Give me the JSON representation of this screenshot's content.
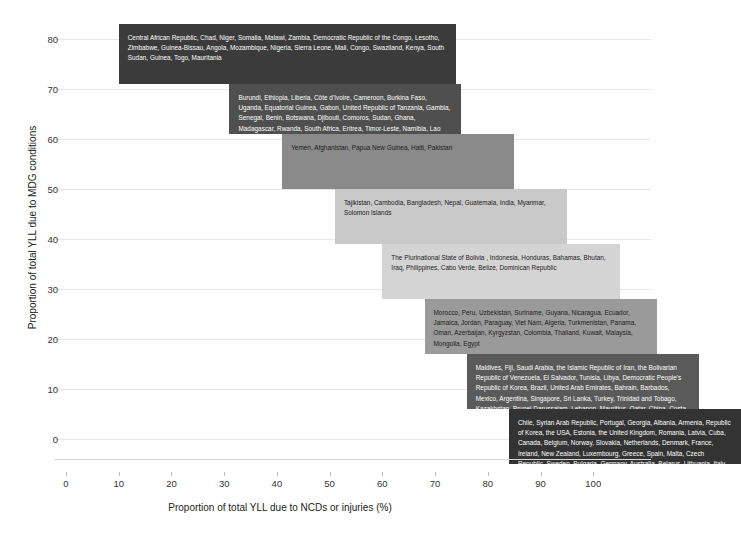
{
  "chart_data": {
    "type": "bar",
    "orientation": "horizontal-ranges",
    "title": "",
    "xlabel": "Proportion of total YLL due to NCDs or injuries (%)",
    "ylabel": "Proportion of total YLL due to MDG conditions",
    "xlim": [
      0,
      110
    ],
    "ylim": [
      -4,
      84
    ],
    "xticks": [
      0,
      10,
      20,
      30,
      40,
      50,
      60,
      70,
      80,
      90,
      100
    ],
    "yticks": [
      0,
      10,
      20,
      30,
      40,
      50,
      60,
      70,
      80
    ],
    "grid": true,
    "legend": "none",
    "bands": [
      {
        "id": "band-1",
        "x_start": 10,
        "x_end": 74,
        "y_top": 83,
        "y_bottom": 71,
        "color": "#3b3b3b",
        "text_color": "#ffffff",
        "countries": "Central African Republic, Chad, Niger, Somalia, Malawi,  Zambia, Democratic Republic of the Congo, Lesotho, Zimbabwe, Guinea-Bissau, Angola, Mozambique, Nigeria, Sierra Leone, Mali, Congo, Swaziland, Kenya, South Sudan, Guinea, Togo, Mauritania"
      },
      {
        "id": "band-2",
        "x_start": 31,
        "x_end": 75,
        "y_top": 71,
        "y_bottom": 61,
        "color": "#4f4f4f",
        "text_color": "#ffffff",
        "countries": "Burundi, Ethiopia, Liberia, Côte d'Ivoire, Cameroon, Burkina Faso, Uganda, Equatorial Guinea, Gabon, United Republic of Tanzania, Gambia, Senegal, Benin, Botswana, Djibouti, Comoros, Sudan, Ghana, Madagascar, Rwanda, South Africa, Eritrea, Timor-Leste, Namibia, Lao People's Democratic Republic"
      },
      {
        "id": "band-3",
        "x_start": 41,
        "x_end": 85,
        "y_top": 61,
        "y_bottom": 50,
        "color": "#8a8a8a",
        "text_color": "#1a1a1a",
        "countries": "Yemen, Afghanistan, Papua New Guinea, Haiti, Pakistan"
      },
      {
        "id": "band-4",
        "x_start": 51,
        "x_end": 95,
        "y_top": 50,
        "y_bottom": 39,
        "color": "#c9c9c9",
        "text_color": "#1a1a1a",
        "countries": "Tajikistan, Cambodia, Bangladesh, Nepal, Guatemala, India, Myanmar, Solomon Islands"
      },
      {
        "id": "band-5",
        "x_start": 60,
        "x_end": 105,
        "y_top": 39,
        "y_bottom": 28,
        "color": "#d4d4d4",
        "text_color": "#1a1a1a",
        "countries": "The Plurinational State of Bolivia , Indonesia, Honduras,  Bahamas, Bhutan, Iraq, Philippines, Cabo Verde, Belize, Dominican Republic"
      },
      {
        "id": "band-6",
        "x_start": 68,
        "x_end": 112,
        "y_top": 28,
        "y_bottom": 17,
        "color": "#9a9a9a",
        "text_color": "#1a1a1a",
        "countries": "Morocco, Peru, Uzbekistan, Suriname, Guyana, Nicaragua, Ecuador, Jamaica, Jordan, Paraguay, Viet Nam, Algeria, Turkmenistan, Panama, Oman, Azerbaijan, Kyrgyzstan, Colombia, Thailand, Kuwait, Malaysia, Mongolia, Egypt"
      },
      {
        "id": "band-7",
        "x_start": 76,
        "x_end": 120,
        "y_top": 17,
        "y_bottom": 6,
        "color": "#5a5a5a",
        "text_color": "#ffffff",
        "countries": "Maldives, Fiji, Saudi Arabia, the Islamic Republic of Iran, the Bolivarian Republic of Venezuela, El Salvador, Tunisia, Libya, Democratic People's Republic of Korea, Brazil, United Arab Emirates, Bahrain, Barbados, Mexico, Argentina, Singapore, Sri Lanka, Turkey, Trinidad and Tobago, Kazakhstan, Brunei Darussalam, Lebanon, Mauritius, Qatar, China, Costa Rica, Ukraine, Russian Federation, Uruguay, Japan, Israel, Republic of Moldova"
      },
      {
        "id": "band-8",
        "x_start": 84,
        "x_end": 128,
        "y_top": 6,
        "y_bottom": -5,
        "color": "#333333",
        "text_color": "#ffffff",
        "countries": "Chile, Syrian Arab Republic, Portugal, Georgia, Albania, Armenia, Republic of Korea, the USA, Estonia, the United Kingdom, Romania, Latvia, Cuba, Canada, Belgium, Norway, Slovakia, Netherlands, Denmark, France, Ireland, New Zealand, Luxembourg, Greece, Spain, Malta, Czech Republic, Sweden, Bulgaria, Germany, Australia, Belarus, Lithuania, Italy, Switzerland, Cyprus, Poland, Iceland, Montenegro, the former Yugoslav Republic of Macedonia, Bosnia and Herzegovina, Serbia, Slovenia, Austria, Hungary, Croatia, Finland"
      }
    ]
  }
}
